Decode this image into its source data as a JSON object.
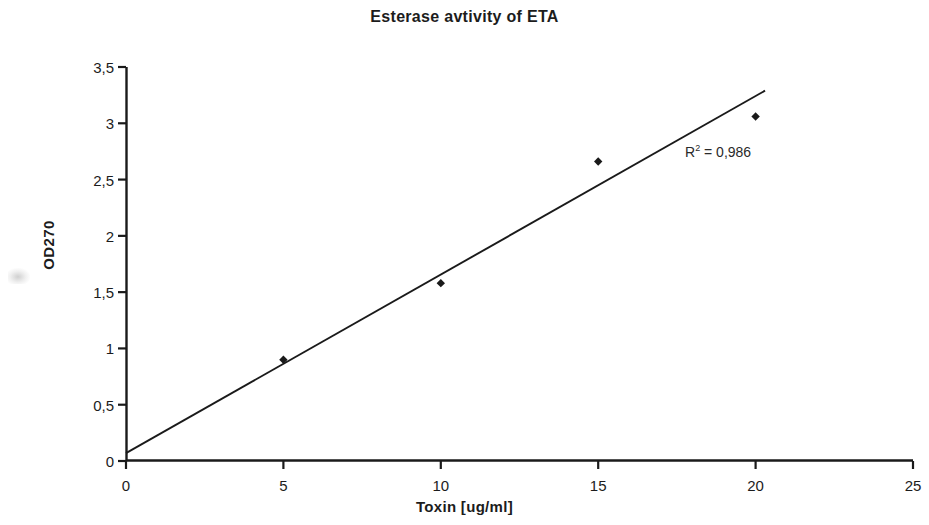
{
  "chart_data": {
    "type": "scatter",
    "title": "Esterase avtivity of ETA",
    "xlabel": "Toxin [ug/ml]",
    "ylabel": "OD270",
    "xlim": [
      0,
      25
    ],
    "ylim": [
      0,
      3.5
    ],
    "grid": false,
    "legend": null,
    "decimal_separator": ",",
    "x_ticks": [
      0,
      5,
      10,
      15,
      20,
      25
    ],
    "x_tick_labels": [
      "0",
      "5",
      "10",
      "15",
      "20",
      "25"
    ],
    "y_ticks": [
      0,
      0.5,
      1,
      1.5,
      2,
      2.5,
      3,
      3.5
    ],
    "y_tick_labels": [
      "0",
      "0,5",
      "1",
      "1,5",
      "2",
      "2,5",
      "3",
      "3,5"
    ],
    "series": [
      {
        "name": "OD270 measurements",
        "type": "scatter",
        "marker": "diamond",
        "color": "#1a1a1a",
        "x": [
          5,
          10,
          15,
          20
        ],
        "y": [
          0.9,
          1.58,
          2.66,
          3.06
        ]
      },
      {
        "name": "Linear trendline",
        "type": "line",
        "color": "#1a1a1a",
        "x": [
          0,
          20.3
        ],
        "y": [
          0.07,
          3.29
        ]
      }
    ],
    "annotations": [
      {
        "name": "r-squared",
        "text": "R2 = 0,986",
        "base": "R",
        "exponent": "2",
        "value_text": " = 0,986",
        "x": 17.7,
        "y": 2.8
      }
    ]
  },
  "chart": {
    "title": "Esterase avtivity of ETA",
    "x_axis_title": "Toxin [ug/ml]",
    "y_axis_title": "OD270"
  }
}
